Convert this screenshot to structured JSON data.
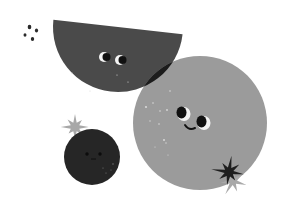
{
  "illustration": {
    "description": "Three cute fruit-like characters with faces: a dark half-circle, a large gray circle, and a small dark circle, with sparkle stars and dots",
    "colors": {
      "background": "#ffffff",
      "half_circle": "#4a4a4a",
      "big_circle": "#9b9b9b",
      "overlap": "#1c1c1c",
      "small_circle": "#262626",
      "star_light": "#a8a8a8",
      "star_dark": "#1e1e1e",
      "eye_white": "#f4f4f4",
      "pupil": "#111111",
      "speckle": "#d8d8d8",
      "dots": "#2a2a2a"
    },
    "characters": [
      {
        "name": "half-circle-character",
        "expression": "looking",
        "has_mouth": false
      },
      {
        "name": "big-circle-character",
        "expression": "smiling",
        "has_mouth": true
      },
      {
        "name": "small-circle-character",
        "expression": "neutral",
        "has_mouth": true
      }
    ],
    "decorations": [
      "sparkle-star-light",
      "sparkle-star-dark",
      "sparkle-star-light-small",
      "dot-cluster"
    ]
  }
}
